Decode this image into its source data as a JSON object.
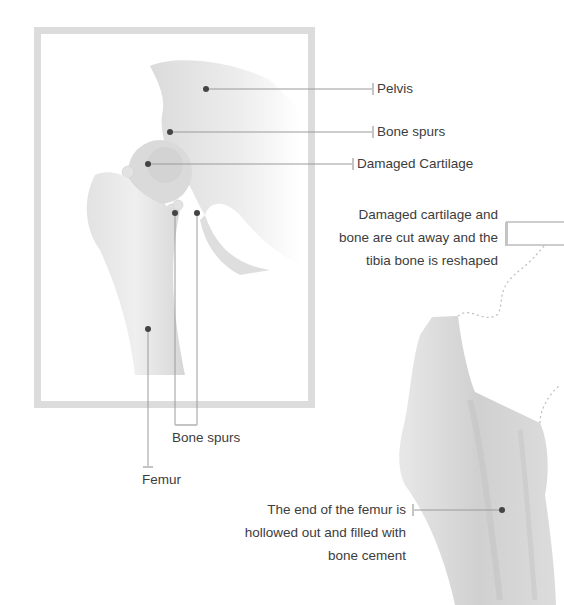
{
  "diagram": {
    "title_hidden": "",
    "labels": {
      "pelvis": "Pelvis",
      "bone_spurs_upper": "Bone spurs",
      "damaged_cartilage": "Damaged Cartilage",
      "bone_spurs_lower": "Bone spurs",
      "femur": "Femur",
      "cut_away": [
        "Damaged cartilage and",
        "bone are cut away and the",
        "tibia bone is reshaped"
      ],
      "hollowed": [
        "The end of the femur is",
        "hollowed out and filled with",
        "bone cement"
      ]
    },
    "colors": {
      "frame": "#dcdcdc",
      "bone": "#e6e6e6",
      "leader_line": "#9a9a9a",
      "marker_dot": "#444444",
      "text": "#3c3c3c"
    }
  }
}
